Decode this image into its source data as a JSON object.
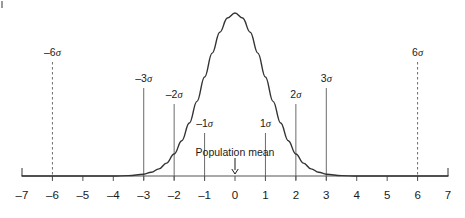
{
  "chart_data": {
    "type": "line",
    "title": "",
    "subtitle": "",
    "xlabel": "",
    "ylabel": "",
    "xlim": [
      -7,
      7
    ],
    "ylim": [
      0,
      1
    ],
    "grid": false,
    "legend": null,
    "curve": {
      "name": "normal-distribution",
      "distribution": "gaussian",
      "mean": 0,
      "sigma": 1,
      "peak_x": 0,
      "peak_y": 1,
      "color": "#333333",
      "x": [
        -7,
        -6.5,
        -6,
        -5.5,
        -5,
        -4.5,
        -4,
        -3.5,
        -3,
        -2.75,
        -2.5,
        -2.25,
        -2,
        -1.75,
        -1.5,
        -1.25,
        -1,
        -0.75,
        -0.5,
        -0.25,
        0,
        0.25,
        0.5,
        0.75,
        1,
        1.25,
        1.5,
        1.75,
        2,
        2.25,
        2.5,
        2.75,
        3,
        3.5,
        4,
        4.5,
        5,
        5.5,
        6,
        6.5,
        7
      ],
      "y": [
        0.0,
        0.0,
        0.0,
        0.0,
        0.0,
        0.0,
        0.0,
        0.002,
        0.011,
        0.023,
        0.044,
        0.079,
        0.135,
        0.216,
        0.325,
        0.458,
        0.607,
        0.754,
        0.882,
        0.969,
        1.0,
        0.969,
        0.882,
        0.754,
        0.607,
        0.458,
        0.325,
        0.216,
        0.135,
        0.079,
        0.044,
        0.023,
        0.011,
        0.002,
        0.0,
        0.0,
        0.0,
        0.0,
        0.0,
        0.0,
        0.0
      ]
    },
    "x_ticks": [
      {
        "value": -7,
        "label": "–7"
      },
      {
        "value": -6,
        "label": "–6"
      },
      {
        "value": -5,
        "label": "–5"
      },
      {
        "value": -4,
        "label": "–4"
      },
      {
        "value": -3,
        "label": "–3"
      },
      {
        "value": -2,
        "label": "–2"
      },
      {
        "value": -1,
        "label": "–1"
      },
      {
        "value": 0,
        "label": "0"
      },
      {
        "value": 1,
        "label": "1"
      },
      {
        "value": 2,
        "label": "2"
      },
      {
        "value": 3,
        "label": "3"
      },
      {
        "value": 4,
        "label": "4"
      },
      {
        "value": 5,
        "label": "5"
      },
      {
        "value": 6,
        "label": "6"
      },
      {
        "value": 7,
        "label": "7"
      }
    ],
    "sigma_markers": [
      {
        "id": "minus-6-sigma",
        "value": -6,
        "sign": "–",
        "magnitude": "6",
        "symbol": "σ",
        "style": "dashed",
        "top_y": 62,
        "label_y": 47
      },
      {
        "id": "minus-3-sigma",
        "value": -3,
        "sign": "–",
        "magnitude": "3",
        "symbol": "σ",
        "style": "solid",
        "top_y": 88,
        "label_y": 73
      },
      {
        "id": "minus-2-sigma",
        "value": -2,
        "sign": "–",
        "magnitude": "2",
        "symbol": "σ",
        "style": "solid",
        "top_y": 104,
        "label_y": 89
      },
      {
        "id": "minus-1-sigma",
        "value": -1,
        "sign": "–",
        "magnitude": "1",
        "symbol": "σ",
        "style": "solid",
        "top_y": 133,
        "label_y": 118
      },
      {
        "id": "plus-1-sigma",
        "value": 1,
        "sign": "",
        "magnitude": "1",
        "symbol": "σ",
        "style": "solid",
        "top_y": 133,
        "label_y": 118
      },
      {
        "id": "plus-2-sigma",
        "value": 2,
        "sign": "",
        "magnitude": "2",
        "symbol": "σ",
        "style": "solid",
        "top_y": 104,
        "label_y": 89
      },
      {
        "id": "plus-3-sigma",
        "value": 3,
        "sign": "",
        "magnitude": "3",
        "symbol": "σ",
        "style": "solid",
        "top_y": 88,
        "label_y": 73
      },
      {
        "id": "plus-6-sigma",
        "value": 6,
        "sign": "",
        "magnitude": "6",
        "symbol": "σ",
        "style": "dashed",
        "top_y": 62,
        "label_y": 47
      }
    ],
    "annotations": [
      {
        "id": "population-mean",
        "text": "Population mean",
        "at_value": 0,
        "label_y": 146,
        "arrow": {
          "glyph": "↓",
          "from_y": 158,
          "to_y": 174
        }
      }
    ],
    "axis": {
      "baseline_y": 176,
      "left_x": 22,
      "right_x": 448,
      "px_per_unit": 30.43,
      "color": "#555555",
      "tick_length": 5,
      "endcap_length": 8
    }
  },
  "colors": {
    "background": "#ffffff",
    "curve": "#333333",
    "axis": "#555555",
    "marker_line": "#6b6b6b",
    "text": "#1a1a1a"
  }
}
